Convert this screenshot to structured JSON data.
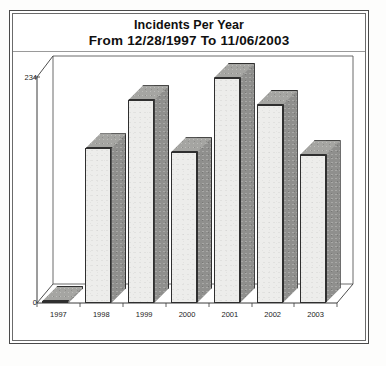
{
  "chart_data": {
    "type": "bar",
    "title": "Incidents Per Year",
    "subtitle": "From 12/28/1997 To 11/06/2003",
    "categories": [
      "1997",
      "1998",
      "1999",
      "2000",
      "2001",
      "2002",
      "2003"
    ],
    "values": [
      2,
      160,
      210,
      156,
      233,
      205,
      153
    ],
    "xlabel": "",
    "ylabel": "",
    "ylim": [
      0,
      234
    ],
    "yticks": [
      0,
      234
    ],
    "ytick_labels": [
      "0",
      "234"
    ],
    "grid": false,
    "legend": false,
    "style_3d": true,
    "bar_face_color": "#ededeb",
    "bar_side_color": "#8f8f8d",
    "bar_top_color": "#a5a5a2",
    "outline_color": "#2f2f2f"
  },
  "chart": {
    "title_line1": "Incidents Per Year",
    "title_line2": "From 12/28/1997 To 11/06/2003",
    "y_axis": {
      "max_label": "234",
      "min_label": "0"
    },
    "x_axis": {
      "labels": [
        "1997",
        "1998",
        "1999",
        "2000",
        "2001",
        "2002",
        "2003"
      ]
    }
  }
}
